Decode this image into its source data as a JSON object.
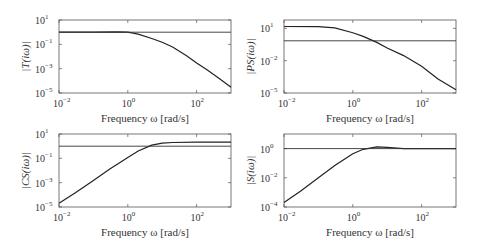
{
  "chart_data": [
    {
      "type": "line",
      "title": "",
      "xlabel": "Frequency ω [rad/s]",
      "ylabel": "|T(iω)|",
      "xscale": "log",
      "yscale": "log",
      "xlim": [
        0.01,
        1000
      ],
      "ylim": [
        1e-05,
        10
      ],
      "xticks": [
        "10^-2",
        "10^0",
        "10^2"
      ],
      "yticks": [
        "10^1",
        "10^-1",
        "10^-3",
        "10^-5"
      ],
      "grid": false,
      "box": {
        "x": 59,
        "y": 20,
        "w": 172,
        "h": 73
      },
      "series": [
        {
          "name": "T",
          "x": [
            0.01,
            0.1,
            0.5,
            1,
            2,
            5,
            10,
            20,
            50,
            100,
            200,
            500,
            1000
          ],
          "y": [
            1.0,
            1.0,
            1.05,
            1.0,
            0.7,
            0.3,
            0.15,
            0.06,
            0.012,
            0.003,
            0.0008,
            0.00013,
            3e-05
          ]
        },
        {
          "name": "reference",
          "x": [
            0.01,
            1000
          ],
          "y": [
            1.0,
            1.0
          ]
        }
      ]
    },
    {
      "type": "line",
      "title": "",
      "xlabel": "Frequency ω [rad/s]",
      "ylabel": "|PS(iω)|",
      "xscale": "log",
      "yscale": "log",
      "xlim": [
        0.01,
        1000
      ],
      "ylim": [
        1e-05,
        60
      ],
      "xticks": [
        "10^-2",
        "10^0",
        "10^2"
      ],
      "yticks": [
        "10^1",
        "10^-2",
        "10^-5"
      ],
      "grid": false,
      "box": {
        "x": 284,
        "y": 20,
        "w": 172,
        "h": 73
      },
      "series": [
        {
          "name": "PS",
          "x": [
            0.01,
            0.1,
            0.3,
            1,
            2,
            5,
            10,
            30,
            100,
            300,
            1000
          ],
          "y": [
            15,
            14.5,
            11,
            4,
            1.8,
            0.5,
            0.15,
            0.03,
            0.003,
            0.0002,
            2e-05
          ]
        },
        {
          "name": "reference",
          "x": [
            0.01,
            1000
          ],
          "y": [
            0.7,
            0.7
          ]
        }
      ]
    },
    {
      "type": "line",
      "title": "",
      "xlabel": "Frequency ω [rad/s]",
      "ylabel": "|CS(iω)|",
      "xscale": "log",
      "yscale": "log",
      "xlim": [
        0.01,
        1000
      ],
      "ylim": [
        1e-05,
        10
      ],
      "xticks": [
        "10^-2",
        "10^0",
        "10^2"
      ],
      "yticks": [
        "10^1",
        "10^-1",
        "10^-3",
        "10^-5"
      ],
      "grid": false,
      "box": {
        "x": 59,
        "y": 134,
        "w": 172,
        "h": 73
      },
      "series": [
        {
          "name": "CS",
          "x": [
            0.01,
            0.03,
            0.1,
            0.3,
            1,
            2,
            5,
            10,
            20,
            100,
            1000
          ],
          "y": [
            2e-05,
            0.00015,
            0.0015,
            0.013,
            0.12,
            0.4,
            1.2,
            1.8,
            2.0,
            2.1,
            2.1
          ]
        },
        {
          "name": "reference",
          "x": [
            0.01,
            1000
          ],
          "y": [
            1.0,
            1.0
          ]
        }
      ]
    },
    {
      "type": "line",
      "title": "",
      "xlabel": "Frequency ω [rad/s]",
      "ylabel": "|S(iω)|",
      "xscale": "log",
      "yscale": "log",
      "xlim": [
        0.01,
        1000
      ],
      "ylim": [
        0.0001,
        10
      ],
      "xticks": [
        "10^-2",
        "10^0",
        "10^2"
      ],
      "yticks": [
        "10^0",
        "10^-2",
        "10^-4"
      ],
      "grid": false,
      "box": {
        "x": 284,
        "y": 134,
        "w": 172,
        "h": 73
      },
      "series": [
        {
          "name": "S",
          "x": [
            0.01,
            0.03,
            0.1,
            0.3,
            1,
            2,
            5,
            10,
            30,
            100,
            1000
          ],
          "y": [
            0.0002,
            0.0012,
            0.01,
            0.07,
            0.45,
            0.9,
            1.3,
            1.2,
            1.0,
            1.0,
            1.0
          ]
        },
        {
          "name": "reference",
          "x": [
            0.01,
            1000
          ],
          "y": [
            1.0,
            1.0
          ]
        }
      ]
    }
  ],
  "labels": {
    "xlabel": "Frequency ω [rad/s]",
    "p1_ylabel": "|T(iω)|",
    "p2_ylabel": "|PS(iω)|",
    "p3_ylabel": "|CS(iω)|",
    "p4_ylabel": "|S(iω)|"
  }
}
